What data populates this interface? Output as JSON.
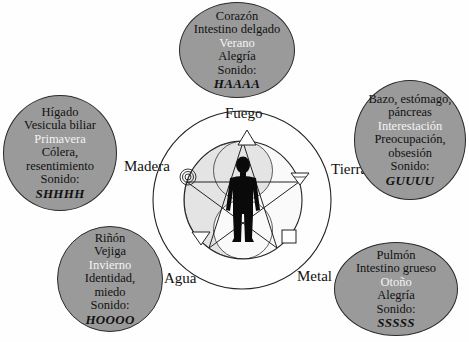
{
  "diagram": {
    "center": {
      "figure": "human-silhouette",
      "symbols": [
        "pentagram",
        "yin-yang"
      ]
    },
    "elements": [
      {
        "name": "Fuego",
        "symbol": "triangle-up",
        "lines": [
          "Corazón",
          "Intestino delgado"
        ],
        "season": "Verano",
        "emotion": [
          "Alegría"
        ],
        "sound_label": "Sonido:",
        "sound": "HAAAA"
      },
      {
        "name": "Tierra",
        "symbol": "triangle-down-with-line",
        "lines": [
          "Bazo, estómago,",
          "páncreas"
        ],
        "season": "Interestación",
        "emotion": [
          "Preocupación,",
          "obsesión"
        ],
        "sound_label": "Sonido:",
        "sound": "GUUUU"
      },
      {
        "name": "Metal",
        "symbol": "square",
        "lines": [
          "Pulmón",
          "Intestino grueso"
        ],
        "season": "Otoño",
        "emotion": [
          "Alegría"
        ],
        "sound_label": "Sonido:",
        "sound": "SSSSS"
      },
      {
        "name": "Agua",
        "symbol": "triangle-down",
        "lines": [
          "Riñón",
          "Vejiga"
        ],
        "season": "Invierno",
        "emotion": [
          "Identidad,",
          "miedo"
        ],
        "sound_label": "Sonido:",
        "sound": "HOOOO"
      },
      {
        "name": "Madera",
        "symbol": "concentric-circles",
        "lines": [
          "Hígado",
          "Vesicula biliar"
        ],
        "season": "Primavera",
        "emotion": [
          "Cólera,",
          "resentimiento"
        ],
        "sound_label": "Sonido:",
        "sound": "SHHHH"
      }
    ],
    "colors": {
      "oval_fill": "#9a9a9a",
      "oval_border": "#2a2a2a",
      "season_text": "#f4f4f4",
      "inner_shade": "#e6e6e6",
      "figure": "#0a0a0a",
      "background": "#fefefe"
    }
  }
}
